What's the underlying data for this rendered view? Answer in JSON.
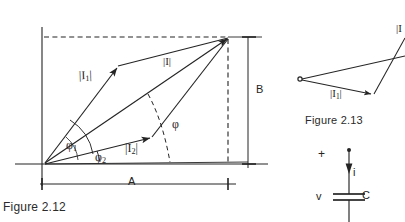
{
  "page": {
    "background": "#ffffff",
    "ink": "#242424"
  },
  "figure_212": {
    "caption": "Figure 2.12",
    "vectors": {
      "i1_label": "|I",
      "i1_sub": "1",
      "i1_close": "|",
      "i_label": "|I|",
      "i2_label": "|I",
      "i2_sub": "2",
      "i2_close": "|"
    },
    "angles": {
      "phi1": "φ",
      "phi1_sub": "1",
      "phi2": "φ",
      "phi2_sub": "2",
      "phi": "φ"
    },
    "dimensions": {
      "horizontal": "A",
      "vertical": "B"
    }
  },
  "figure_213": {
    "caption": "Figure 2.13",
    "i1_label": "|I",
    "i1_sub": "1",
    "i1_close": "|",
    "i_label": "|I"
  },
  "circuit": {
    "polarity": "+",
    "current": "i",
    "voltage": "v",
    "component": "C"
  }
}
